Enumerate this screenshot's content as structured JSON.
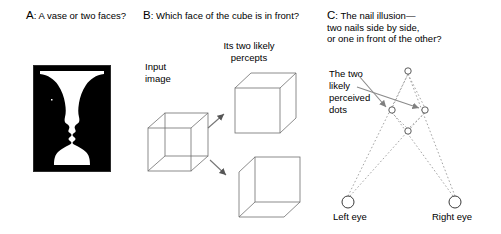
{
  "figure": {
    "width": 501,
    "height": 234,
    "background": "#ffffff",
    "ink": "#000000",
    "line_gray": "#6b6b6b",
    "arrow_gray": "#808080"
  },
  "panel_a": {
    "id": "A",
    "caption": "A: A vase or two faces?",
    "caption_lead": "A",
    "caption_rest": ": A vase or two faces?",
    "figure_name": "rubin-vase-illusion",
    "figure_description": "Black-and-white Rubin vase: white vase on black ground, equally readable as two facing profiles.",
    "colors": {
      "ground": "#000000",
      "figure": "#ffffff"
    }
  },
  "panel_b": {
    "id": "B",
    "caption": "B: Which face of the cube is in front?",
    "caption_lead": "B",
    "caption_rest": ": Which face of the cube is in front?",
    "labels": {
      "input_image": "Input\nimage",
      "percepts": "Its two likely\npercepts"
    },
    "figures": [
      {
        "name": "necker-cube-input",
        "description": "Ambiguous wireframe Necker cube"
      },
      {
        "name": "percept-front-lower-left",
        "description": "Cube drawn with the lower-left square as the front face"
      },
      {
        "name": "percept-front-upper-right",
        "description": "Cube drawn with the upper-right square as the front face"
      }
    ],
    "arrows": [
      {
        "name": "arrow-to-top-percept",
        "direction": "up-right"
      },
      {
        "name": "arrow-to-bottom-percept",
        "direction": "down-right"
      }
    ]
  },
  "panel_c": {
    "id": "C",
    "caption": "C: The nail illusion—\ntwo nails side by side,\nor one in front of the other?",
    "caption_lead": "C",
    "caption_rest": ": The nail illusion—\ntwo nails side by side,\nor one in front of the other?",
    "labels": {
      "perceived_dots": "The two\nlikely\nperceived\ndots",
      "left_eye": "Left eye",
      "right_eye": "Right eye"
    },
    "dots": [
      {
        "name": "dot-top",
        "x": 408,
        "y": 71
      },
      {
        "name": "dot-left",
        "x": 392,
        "y": 110
      },
      {
        "name": "dot-right",
        "x": 425,
        "y": 110
      },
      {
        "name": "dot-bottom",
        "x": 408,
        "y": 131
      }
    ],
    "eyes": [
      {
        "name": "left-eye-circle",
        "x": 348,
        "y": 202,
        "r": 6
      },
      {
        "name": "right-eye-circle",
        "x": 455,
        "y": 202,
        "r": 6
      }
    ],
    "sight_lines": [
      {
        "name": "left-eye-to-dot-top",
        "from": "left-eye",
        "to": "dot-top"
      },
      {
        "name": "left-eye-to-dot-right",
        "from": "left-eye",
        "to": "dot-right"
      },
      {
        "name": "right-eye-to-dot-top",
        "from": "right-eye",
        "to": "dot-top"
      },
      {
        "name": "right-eye-to-dot-left",
        "from": "right-eye",
        "to": "dot-left"
      }
    ],
    "pointer_arrows": [
      {
        "name": "pointer-to-dot-left",
        "to": "dot-left"
      },
      {
        "name": "pointer-to-dot-right",
        "to": "dot-right"
      }
    ]
  }
}
